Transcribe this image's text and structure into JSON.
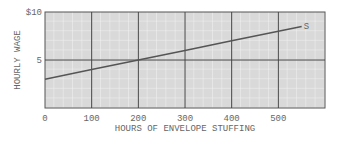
{
  "chart_data": {
    "type": "line",
    "title": "",
    "xlabel": "HOURS OF ENVELOPE STUFFING",
    "ylabel": "HOURLY WAGE",
    "x_ticks": [
      "0",
      "100",
      "200",
      "300",
      "400",
      "500"
    ],
    "y_ticks": [
      "5",
      "$10"
    ],
    "xlim": [
      0,
      600
    ],
    "ylim": [
      0,
      10
    ],
    "grid": true,
    "series": [
      {
        "name": "S",
        "x": [
          0,
          100,
          200,
          300,
          400,
          500,
          550
        ],
        "y": [
          3,
          4,
          5,
          6,
          7,
          8,
          8.5
        ]
      }
    ],
    "annotations": [
      "S"
    ]
  }
}
